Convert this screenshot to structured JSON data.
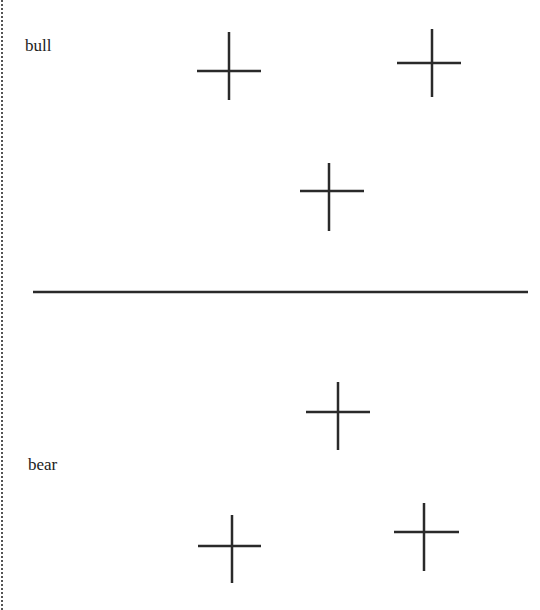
{
  "labels": {
    "top": "bull",
    "bottom": "bear"
  },
  "colors": {
    "stroke": "#2a2a2a",
    "border": "#555555",
    "background": "#ffffff"
  },
  "divider": {
    "x1": 33,
    "x2": 528,
    "y": 292
  },
  "crosses": [
    {
      "cx": 229,
      "cy": 71,
      "vy1": 32,
      "vy2": 100,
      "hx1": 197,
      "hx2": 261
    },
    {
      "cx": 432,
      "cy": 63,
      "vy1": 29,
      "vy2": 97,
      "hx1": 397,
      "hx2": 461
    },
    {
      "cx": 329,
      "cy": 191,
      "vy1": 163,
      "vy2": 231,
      "hx1": 300,
      "hx2": 364
    },
    {
      "cx": 338,
      "cy": 412,
      "vy1": 382,
      "vy2": 450,
      "hx1": 306,
      "hx2": 370
    },
    {
      "cx": 232,
      "cy": 546,
      "vy1": 515,
      "vy2": 583,
      "hx1": 198,
      "hx2": 261
    },
    {
      "cx": 424,
      "cy": 532,
      "vy1": 503,
      "vy2": 571,
      "hx1": 394,
      "hx2": 459
    }
  ]
}
